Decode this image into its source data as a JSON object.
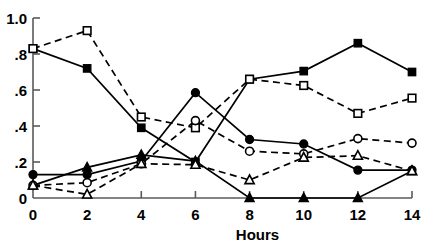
{
  "chart_data": {
    "type": "line",
    "title": "",
    "subtitle": "",
    "xlabel": "Hours",
    "ylabel": "",
    "xlim": [
      0,
      14
    ],
    "ylim": [
      0,
      1.0
    ],
    "grid": false,
    "legend_position": "none",
    "x": [
      0,
      2,
      4,
      6,
      8,
      10,
      12,
      14
    ],
    "xticks": [
      0,
      2,
      4,
      6,
      8,
      10,
      12,
      14
    ],
    "xtick_labels": [
      "0",
      "2",
      "4",
      "6",
      "8",
      "10",
      "12",
      "14"
    ],
    "yticks": [
      0,
      0.2,
      0.4,
      0.6,
      0.8,
      1.0
    ],
    "ytick_labels": [
      "0",
      ".2",
      ".4",
      ".6",
      ".8",
      "1.0"
    ],
    "series": [
      {
        "name": "filled-square",
        "marker": "square",
        "marker_fill": "solid",
        "line_style": "solid",
        "color": "#000000",
        "values": [
          0.83,
          0.72,
          0.39,
          0.2,
          0.66,
          0.705,
          0.86,
          0.7
        ]
      },
      {
        "name": "open-square",
        "marker": "square",
        "marker_fill": "open",
        "line_style": "dashed",
        "color": "#000000",
        "values": [
          0.83,
          0.93,
          0.45,
          0.39,
          0.66,
          0.625,
          0.47,
          0.555
        ]
      },
      {
        "name": "filled-circle",
        "marker": "circle",
        "marker_fill": "solid",
        "line_style": "solid",
        "color": "#000000",
        "values": [
          0.13,
          0.13,
          0.205,
          0.585,
          0.325,
          0.3,
          0.155,
          0.155
        ]
      },
      {
        "name": "open-circle",
        "marker": "circle",
        "marker_fill": "open",
        "line_style": "dashed",
        "color": "#000000",
        "values": [
          0.07,
          0.085,
          0.19,
          0.43,
          0.26,
          0.245,
          0.33,
          0.305
        ]
      },
      {
        "name": "filled-triangle",
        "marker": "triangle",
        "marker_fill": "solid",
        "line_style": "solid",
        "color": "#000000",
        "values": [
          0.07,
          0.17,
          0.24,
          0.205,
          0.0,
          0.0,
          0.0,
          0.15
        ]
      },
      {
        "name": "open-triangle",
        "marker": "triangle",
        "marker_fill": "open",
        "line_style": "dashed",
        "color": "#000000",
        "values": [
          0.07,
          0.02,
          0.19,
          0.185,
          0.1,
          0.225,
          0.235,
          0.15
        ]
      }
    ]
  }
}
